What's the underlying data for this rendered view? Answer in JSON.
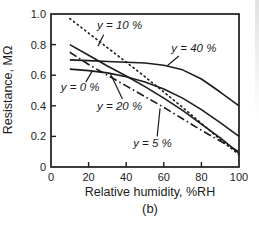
{
  "figure": {
    "caption": "(b)"
  },
  "chart_data": {
    "type": "line",
    "title": "",
    "xlabel": "Relative humidity, %RH",
    "ylabel": "Resistance, MΩ",
    "caption": "(b)",
    "xlim": [
      0,
      100
    ],
    "ylim": [
      0,
      1.0
    ],
    "xticks": [
      0,
      20,
      40,
      60,
      80,
      100
    ],
    "xtick_labels": [
      "0",
      "20",
      "40",
      "60",
      "80",
      "100"
    ],
    "yticks": [
      0,
      0.2,
      0.4,
      0.6,
      0.8,
      1.0
    ],
    "ytick_labels": [
      "0",
      "0.2",
      "0.4",
      "0.6",
      "0.8",
      "1.0"
    ],
    "grid": false,
    "legend_position": "inline-annotations",
    "line_color": "#1c1c1c",
    "x": [
      10,
      20,
      30,
      40,
      50,
      60,
      70,
      80,
      90,
      100
    ],
    "series": [
      {
        "name": "y = 40 %",
        "style": "solid",
        "values": [
          0.7,
          0.695,
          0.69,
          0.685,
          0.68,
          0.665,
          0.635,
          0.575,
          0.49,
          0.4
        ]
      },
      {
        "name": "y = 0 %",
        "style": "solid",
        "values": [
          0.64,
          0.63,
          0.615,
          0.59,
          0.555,
          0.51,
          0.45,
          0.375,
          0.29,
          0.2
        ]
      },
      {
        "name": "y = 20 %",
        "style": "solid",
        "values": [
          0.8,
          0.73,
          0.66,
          0.595,
          0.525,
          0.45,
          0.37,
          0.28,
          0.19,
          0.09
        ]
      },
      {
        "name": "y = 5 %",
        "style": "dash-dot",
        "values": [
          0.75,
          0.67,
          0.6,
          0.53,
          0.46,
          0.39,
          0.315,
          0.24,
          0.17,
          0.1
        ]
      },
      {
        "name": "y = 10 %",
        "style": "dotted",
        "values": [
          0.97,
          0.875,
          0.78,
          0.685,
          0.59,
          0.49,
          0.39,
          0.285,
          0.18,
          0.08
        ]
      }
    ],
    "annotations": [
      {
        "id": "label-y-10",
        "text": "y = 10 %",
        "tx": 36.5,
        "ty": 0.93,
        "lx1": 28.0,
        "ly1": 0.865,
        "lx2": 25.0,
        "ly2": 0.79
      },
      {
        "id": "label-y-40",
        "text": "y = 40 %",
        "tx": 76.0,
        "ty": 0.78,
        "lx1": 68.0,
        "ly1": 0.725,
        "lx2": 62.0,
        "ly2": 0.663
      },
      {
        "id": "label-y-0",
        "text": "y = 0 %",
        "tx": 15.5,
        "ty": 0.52,
        "lx1": 18.5,
        "ly1": 0.555,
        "lx2": 22.0,
        "ly2": 0.628
      },
      {
        "id": "label-y-20",
        "text": "y = 20 %",
        "tx": 36.5,
        "ty": 0.4,
        "lx1": 38.0,
        "ly1": 0.445,
        "lx2": 31.5,
        "ly2": 0.613
      },
      {
        "id": "label-y-5",
        "text": "y = 5 %",
        "tx": 54.0,
        "ty": 0.155,
        "lx1": 56.5,
        "ly1": 0.2,
        "lx2": 58.0,
        "ly2": 0.383
      }
    ]
  }
}
